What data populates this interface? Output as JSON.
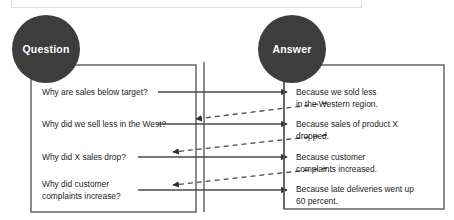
{
  "diagram": {
    "title_nodes": {
      "question": "Question",
      "answer": "Answer"
    },
    "colors": {
      "node_fill": "#3d3d3d",
      "node_text": "#ffffff",
      "box_border": "#5a5a5a",
      "solid_line": "#4a4a4a",
      "dashed_line": "#4a4a4a",
      "body_text": "#1c1c1c",
      "panel_border": "#dcdcdc",
      "background": "#ffffff"
    },
    "questions": [
      {
        "id": "q1",
        "text": "Why are sales below target?"
      },
      {
        "id": "q2",
        "text": "Why did we sell less in the West?"
      },
      {
        "id": "q3",
        "text": "Why did X sales drop?"
      },
      {
        "id": "q4",
        "text": "Why did customer\ncomplaints increase?"
      }
    ],
    "answers": [
      {
        "id": "a1",
        "text": "Because we sold less\nin the Western region."
      },
      {
        "id": "a2",
        "text": "Because sales of product X\ndropped."
      },
      {
        "id": "a3",
        "text": "Because customer\ncomplaints increased."
      },
      {
        "id": "a4",
        "text": "Because late deliveries went up\n60 percent."
      }
    ],
    "links_forward": [
      {
        "from": "q1",
        "to": "a1",
        "style": "solid",
        "arrow": "right"
      },
      {
        "from": "q2",
        "to": "a2",
        "style": "solid",
        "arrow": "right"
      },
      {
        "from": "q3",
        "to": "a3",
        "style": "solid",
        "arrow": "right"
      },
      {
        "from": "q4",
        "to": "a4",
        "style": "solid",
        "arrow": "right"
      }
    ],
    "links_back": [
      {
        "from": "a1",
        "to": "q2",
        "style": "dashed",
        "arrow": "left"
      },
      {
        "from": "a2",
        "to": "q3",
        "style": "dashed",
        "arrow": "left"
      },
      {
        "from": "a3",
        "to": "q4",
        "style": "dashed",
        "arrow": "left"
      }
    ]
  }
}
